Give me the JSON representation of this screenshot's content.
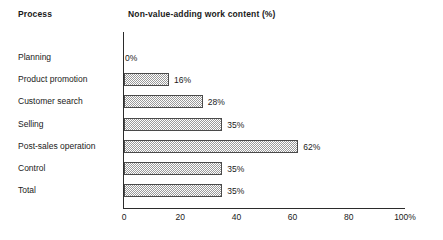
{
  "header": {
    "process_label": "Process",
    "value_label": "Non-value-adding work content (%)"
  },
  "chart_data": {
    "type": "bar",
    "orientation": "horizontal",
    "title": "Non-value-adding work content (%)",
    "xlabel": "",
    "ylabel": "Process",
    "xlim": [
      0,
      100
    ],
    "grid": false,
    "legend": null,
    "categories": [
      "Planning",
      "Product promotion",
      "Customer search",
      "Selling",
      "Post-sales operation",
      "Control",
      "Total"
    ],
    "values": [
      0,
      16,
      28,
      35,
      62,
      35,
      35
    ],
    "data_labels": [
      "0%",
      "16%",
      "28%",
      "35%",
      "62%",
      "35%",
      "35%"
    ],
    "xticks": [
      0,
      20,
      40,
      60,
      80,
      100
    ],
    "xticklabels": [
      "0",
      "20",
      "40",
      "60",
      "80",
      "100%"
    ],
    "bar_fill": "#9a9a9a",
    "bar_border": "#4a4a4a",
    "axis_color": "#2b2b2b",
    "background": "#ffffff"
  }
}
